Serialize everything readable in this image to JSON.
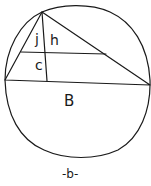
{
  "diagram": {
    "labels": {
      "j": "j",
      "h": "h",
      "c": "c",
      "B": "B"
    },
    "caption": "-b-",
    "colors": {
      "ink": "#1a1a1a",
      "background": "#ffffff"
    }
  }
}
